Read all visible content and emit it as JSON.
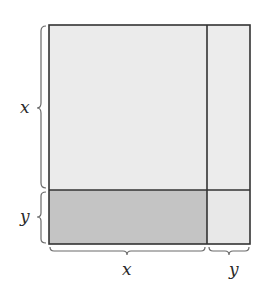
{
  "diagram": {
    "left_labels": {
      "top": "x",
      "bottom": "y"
    },
    "bottom_labels": {
      "left": "x",
      "right": "y"
    },
    "colors": {
      "light_region": "#ebebeb",
      "dark_region": "#c4c4c4",
      "outline": "#333333",
      "brace": "#6a6a6a"
    },
    "regions": [
      {
        "name": "x-squared",
        "shade": "light"
      },
      {
        "name": "xy-right",
        "shade": "light"
      },
      {
        "name": "xy-bottom",
        "shade": "dark"
      },
      {
        "name": "y-squared",
        "shade": "light"
      }
    ]
  }
}
